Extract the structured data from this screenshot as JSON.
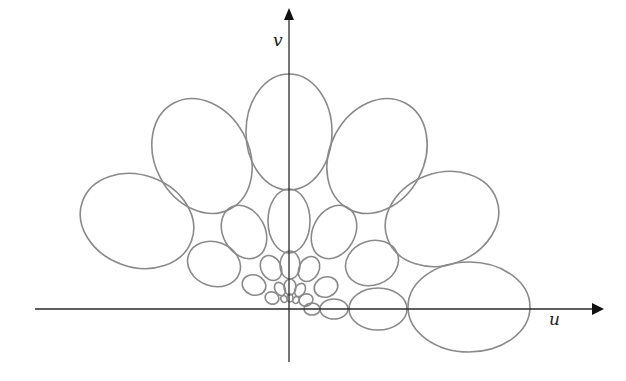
{
  "diagram": {
    "title": "",
    "axes": {
      "u_label": "u",
      "v_label": "v",
      "origin": [
        289,
        309
      ],
      "u_axis": {
        "x1": 35,
        "x2": 592,
        "y": 309
      },
      "v_axis": {
        "x": 289,
        "y1": 20,
        "y2": 362
      },
      "color": "#2a2a2a"
    },
    "ellipse_color": "#8a8a8a",
    "ellipses": [
      {
        "ring": "outer",
        "cx": 289,
        "cy": 132,
        "rx": 43,
        "ry": 58,
        "rot": 0
      },
      {
        "ring": "outer",
        "cx": 202,
        "cy": 156,
        "rx": 47,
        "ry": 60,
        "rot": -28
      },
      {
        "ring": "outer",
        "cx": 377,
        "cy": 156,
        "rx": 47,
        "ry": 60,
        "rot": 28
      },
      {
        "ring": "outer",
        "cx": 137,
        "cy": 221,
        "rx": 58,
        "ry": 46,
        "rot": 20
      },
      {
        "ring": "outer",
        "cx": 442,
        "cy": 219,
        "rx": 58,
        "ry": 46,
        "rot": -20
      },
      {
        "ring": "outer",
        "cx": 469,
        "cy": 307,
        "rx": 61,
        "ry": 45,
        "rot": 0
      },
      {
        "ring": "mid",
        "cx": 289,
        "cy": 221,
        "rx": 21,
        "ry": 32,
        "rot": 0
      },
      {
        "ring": "mid",
        "cx": 244,
        "cy": 232,
        "rx": 21,
        "ry": 28,
        "rot": -28
      },
      {
        "ring": "mid",
        "cx": 334,
        "cy": 232,
        "rx": 21,
        "ry": 28,
        "rot": 28
      },
      {
        "ring": "mid",
        "cx": 214,
        "cy": 264,
        "rx": 27,
        "ry": 22,
        "rot": 20
      },
      {
        "ring": "mid",
        "cx": 372,
        "cy": 263,
        "rx": 27,
        "ry": 22,
        "rot": -20
      },
      {
        "ring": "mid",
        "cx": 378,
        "cy": 309,
        "rx": 29,
        "ry": 21,
        "rot": 0
      },
      {
        "ring": "small",
        "cx": 290,
        "cy": 265,
        "rx": 10,
        "ry": 14,
        "rot": 0
      },
      {
        "ring": "small",
        "cx": 271,
        "cy": 268,
        "rx": 10,
        "ry": 13,
        "rot": -28
      },
      {
        "ring": "small",
        "cx": 309,
        "cy": 269,
        "rx": 10,
        "ry": 13,
        "rot": 28
      },
      {
        "ring": "small",
        "cx": 254,
        "cy": 285,
        "rx": 12,
        "ry": 10,
        "rot": 20
      },
      {
        "ring": "small",
        "cx": 326,
        "cy": 287,
        "rx": 12,
        "ry": 10,
        "rot": -20
      },
      {
        "ring": "small",
        "cx": 334,
        "cy": 309,
        "rx": 14,
        "ry": 10,
        "rot": 0
      },
      {
        "ring": "tiny",
        "cx": 290,
        "cy": 287,
        "rx": 6,
        "ry": 8,
        "rot": 0
      },
      {
        "ring": "tiny",
        "cx": 280,
        "cy": 289,
        "rx": 5,
        "ry": 7,
        "rot": -28
      },
      {
        "ring": "tiny",
        "cx": 300,
        "cy": 290,
        "rx": 5,
        "ry": 7,
        "rot": 28
      },
      {
        "ring": "tiny",
        "cx": 272,
        "cy": 298,
        "rx": 7,
        "ry": 6,
        "rot": 20
      },
      {
        "ring": "tiny",
        "cx": 306,
        "cy": 300,
        "rx": 7,
        "ry": 6,
        "rot": -20
      },
      {
        "ring": "tiny",
        "cx": 312,
        "cy": 309,
        "rx": 8,
        "ry": 6,
        "rot": 0
      },
      {
        "ring": "micro",
        "cx": 290,
        "cy": 298,
        "rx": 3,
        "ry": 4,
        "rot": 0
      },
      {
        "ring": "micro",
        "cx": 284,
        "cy": 299,
        "rx": 3,
        "ry": 3.5,
        "rot": -28
      },
      {
        "ring": "micro",
        "cx": 296,
        "cy": 300,
        "rx": 3,
        "ry": 3.5,
        "rot": 28
      }
    ]
  }
}
